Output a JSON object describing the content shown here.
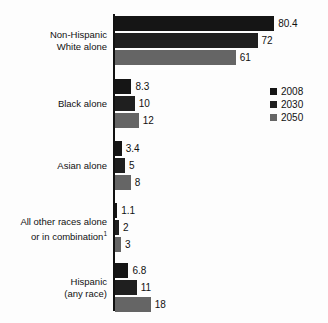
{
  "chart_data": {
    "type": "bar",
    "orientation": "horizontal",
    "title": "",
    "xlabel": "",
    "ylabel": "",
    "xlim": [
      0,
      80.4
    ],
    "grid": false,
    "legend_position": "right",
    "categories": [
      "Non-Hispanic\nWhite alone",
      "Black alone",
      "Asian alone",
      "All other races alone\nor in combination",
      "Hispanic\n(any race)"
    ],
    "series": [
      {
        "name": "2008",
        "color": "#151515",
        "values": [
          80.4,
          8.3,
          3.4,
          1.1,
          6.8
        ]
      },
      {
        "name": "2030",
        "color": "#1f1f1f",
        "values": [
          72,
          10,
          5,
          2,
          11
        ]
      },
      {
        "name": "2050",
        "color": "#656565",
        "values": [
          61,
          12,
          8,
          3,
          18
        ]
      }
    ],
    "value_labels": [
      [
        "80.4",
        "72",
        "61"
      ],
      [
        "8.3",
        "10",
        "12"
      ],
      [
        "3.4",
        "5",
        "8"
      ],
      [
        "1.1",
        "2",
        "3"
      ],
      [
        "6.8",
        "11",
        "18"
      ]
    ]
  },
  "groups": [
    {
      "label_line1": "Non-Hispanic",
      "label_line2": "White alone",
      "footnote": "",
      "bars": [
        {
          "value_label": "80.4",
          "value": 80.4,
          "series": "2008"
        },
        {
          "value_label": "72",
          "value": 72,
          "series": "2030"
        },
        {
          "value_label": "61",
          "value": 61,
          "series": "2050"
        }
      ]
    },
    {
      "label_line1": "Black alone",
      "label_line2": "",
      "footnote": "",
      "bars": [
        {
          "value_label": "8.3",
          "value": 8.3,
          "series": "2008"
        },
        {
          "value_label": "10",
          "value": 10,
          "series": "2030"
        },
        {
          "value_label": "12",
          "value": 12,
          "series": "2050"
        }
      ]
    },
    {
      "label_line1": "Asian alone",
      "label_line2": "",
      "footnote": "",
      "bars": [
        {
          "value_label": "3.4",
          "value": 3.4,
          "series": "2008"
        },
        {
          "value_label": "5",
          "value": 5,
          "series": "2030"
        },
        {
          "value_label": "8",
          "value": 8,
          "series": "2050"
        }
      ]
    },
    {
      "label_line1": "All other races alone",
      "label_line2": "or in combination",
      "footnote": "1",
      "bars": [
        {
          "value_label": "1.1",
          "value": 1.1,
          "series": "2008"
        },
        {
          "value_label": "2",
          "value": 2,
          "series": "2030"
        },
        {
          "value_label": "3",
          "value": 3,
          "series": "2050"
        }
      ]
    },
    {
      "label_line1": "Hispanic",
      "label_line2": "(any race)",
      "footnote": "",
      "bars": [
        {
          "value_label": "6.8",
          "value": 6.8,
          "series": "2008"
        },
        {
          "value_label": "11",
          "value": 11,
          "series": "2030"
        },
        {
          "value_label": "18",
          "value": 18,
          "series": "2050"
        }
      ]
    }
  ],
  "legend": {
    "items": [
      {
        "label": "2008",
        "color": "#151515"
      },
      {
        "label": "2030",
        "color": "#1f1f1f"
      },
      {
        "label": "2050",
        "color": "#656565"
      }
    ]
  }
}
